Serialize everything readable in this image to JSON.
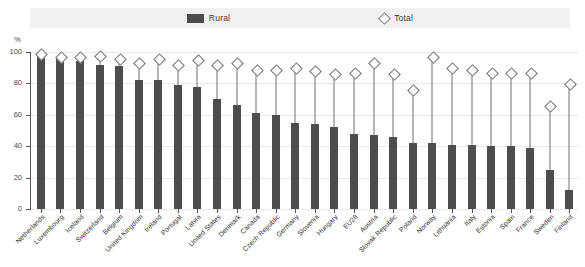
{
  "legend": {
    "rural_label": "Rural",
    "total_label": "Total",
    "rural_color": "#4d4d4d",
    "total_color": "#ffffff"
  },
  "axis": {
    "unit": "%",
    "ticks": [
      "100",
      "80",
      "60",
      "40",
      "20",
      "0"
    ]
  },
  "chart_data": {
    "type": "bar",
    "title": "",
    "xlabel": "",
    "ylabel": "%",
    "ylim": [
      0,
      100
    ],
    "grid": true,
    "legend_position": "top-center",
    "categories": [
      "Netherlands",
      "Luxembourg",
      "Iceland",
      "Switzerland",
      "Belgium",
      "United Kingdom",
      "Ireland",
      "Portugal",
      "Latvia",
      "United States",
      "Denmark",
      "Canada",
      "Czech Republic",
      "Germany",
      "Slovenia",
      "Hungary",
      "EU28",
      "Austria",
      "Slovak Republic",
      "Poland",
      "Norway",
      "Lithuania",
      "Italy",
      "Estonia",
      "Spain",
      "France",
      "Sweden",
      "Finland"
    ],
    "series": [
      {
        "name": "Rural",
        "type": "bar",
        "values": [
          99,
          96,
          94,
          92,
          91,
          82,
          82,
          79,
          78,
          70,
          66,
          61,
          60,
          55,
          54,
          52,
          48,
          47,
          46,
          42,
          42,
          41,
          41,
          40,
          40,
          39,
          25,
          12
        ]
      },
      {
        "name": "Total",
        "type": "marker",
        "values": [
          99,
          97,
          97,
          98,
          96,
          93,
          96,
          92,
          95,
          92,
          93,
          89,
          89,
          90,
          88,
          86,
          87,
          93,
          86,
          76,
          97,
          90,
          89,
          87,
          87,
          87,
          66,
          80
        ]
      }
    ]
  }
}
